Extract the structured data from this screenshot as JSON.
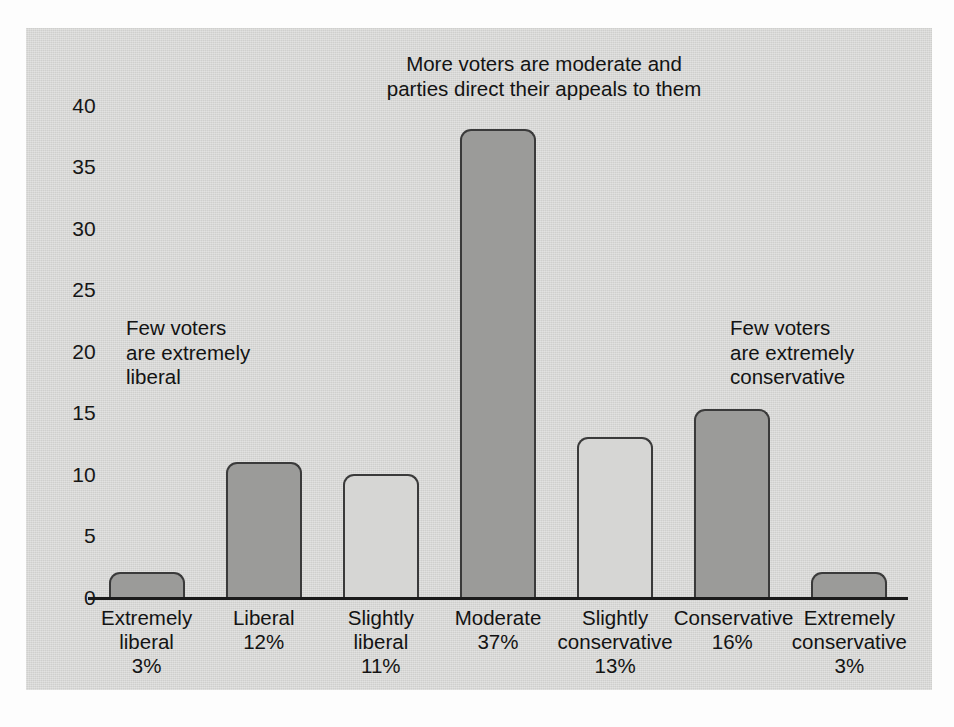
{
  "chart_data": {
    "type": "bar",
    "title": "",
    "subtitle": "",
    "xlabel": "",
    "ylabel": "",
    "grid": false,
    "legend": "none",
    "ylim": [
      0,
      42
    ],
    "yticks": [
      "0",
      "5",
      "10",
      "15",
      "20",
      "25",
      "30",
      "35",
      "40"
    ],
    "ytick_values": [
      0,
      5,
      10,
      15,
      20,
      25,
      30,
      35,
      40
    ],
    "categories": [
      "Extremely liberal",
      "Liberal",
      "Slightly liberal",
      "Moderate",
      "Slightly conservative",
      "Conservative",
      "Extremely conservative"
    ],
    "values": [
      2,
      11,
      10,
      38,
      13,
      15.3,
      2
    ],
    "percent_labels": [
      "3%",
      "12%",
      "11%",
      "37%",
      "13%",
      "16%",
      "3%"
    ],
    "bars": [
      {
        "name": "Extremely liberal",
        "line1": "Extremely",
        "line2": "liberal",
        "line3": "3%",
        "value": 2,
        "shade": "dark"
      },
      {
        "name": "Liberal",
        "line1": "Liberal",
        "line2": "12%",
        "line3": "",
        "value": 11,
        "shade": "dark"
      },
      {
        "name": "Slightly liberal",
        "line1": "Slightly",
        "line2": "liberal",
        "line3": "11%",
        "value": 10,
        "shade": "light"
      },
      {
        "name": "Moderate",
        "line1": "Moderate",
        "line2": "37%",
        "line3": "",
        "value": 38,
        "shade": "dark"
      },
      {
        "name": "Slightly conservative",
        "line1": "Slightly",
        "line2": "conservative",
        "line3": "13%",
        "value": 13,
        "shade": "light"
      },
      {
        "name": "Conservative",
        "line1": "Conservative",
        "line2": "16%",
        "line3": "",
        "value": 15.3,
        "shade": "dark"
      },
      {
        "name": "Extremely conservative",
        "line1": "Extremely",
        "line2": "conservative",
        "line3": "3%",
        "value": 2,
        "shade": "dark"
      }
    ],
    "annotations": [
      {
        "id": "left",
        "text": "Few voters\nare extremely\nliberal"
      },
      {
        "id": "center",
        "text": "More voters are moderate and\nparties direct their appeals to them"
      },
      {
        "id": "right",
        "text": "Few voters\nare extremely\nconservative"
      }
    ]
  },
  "colors": {
    "panel_background": "#d4d4d2",
    "bar_dark_fill": "#9b9b99",
    "bar_light_fill": "#d6d6d4",
    "bar_outline": "#3a3a3a",
    "axis": "#1b1b1b",
    "text": "#131313"
  }
}
